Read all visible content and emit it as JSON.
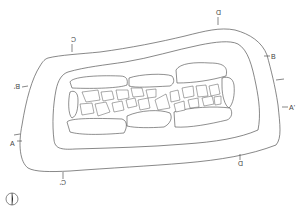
{
  "diagram": {
    "type": "archaeological plan",
    "colors": {
      "line": "#555555",
      "background": "#ffffff"
    },
    "section_labels": [
      {
        "id": "A",
        "text": "A",
        "x": 10,
        "y": 144,
        "rotate": 0
      },
      {
        "id": "A_prime",
        "text": "A'",
        "x": 289,
        "y": 109,
        "rotate": 0
      },
      {
        "id": "B",
        "text": "B",
        "x": 271,
        "y": 58,
        "rotate": 0
      },
      {
        "id": "B_prime",
        "text": "B'",
        "x": 14,
        "y": 88,
        "rotate": 180
      },
      {
        "id": "C",
        "text": "C",
        "x": 73,
        "y": 40,
        "rotate": 180
      },
      {
        "id": "C_prime",
        "text": "C'",
        "x": 63,
        "y": 183,
        "rotate": 180
      },
      {
        "id": "D",
        "text": "D",
        "x": 216,
        "y": 13,
        "rotate": 180
      },
      {
        "id": "D_prime",
        "text": "D",
        "x": 240,
        "y": 163,
        "rotate": 180
      }
    ],
    "north_arrow": {
      "label": "north-arrow",
      "x": 12,
      "y": 200
    }
  }
}
